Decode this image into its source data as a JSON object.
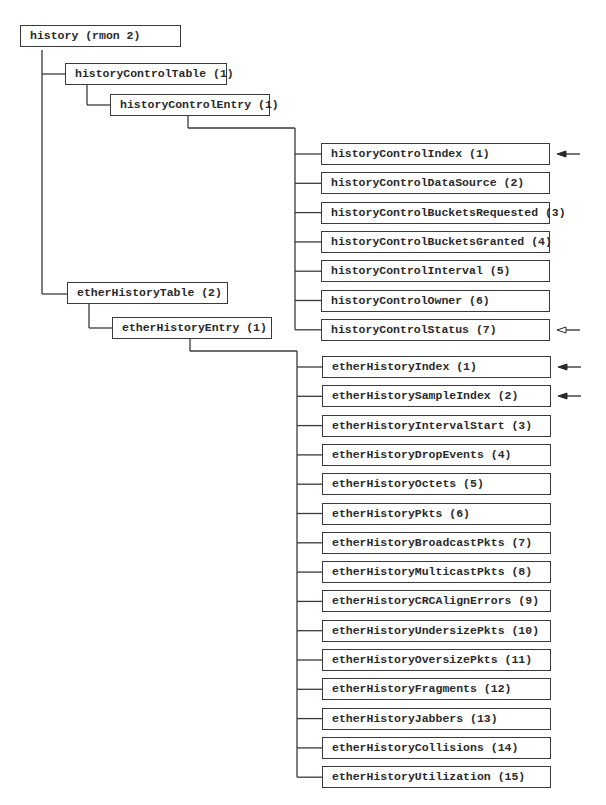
{
  "root": {
    "label": "history (rmon 2)"
  },
  "history_control_table": {
    "label": "historyControlTable (1)"
  },
  "history_control_entry": {
    "label": "historyControlEntry (1)"
  },
  "history_control_columns": [
    {
      "label": "historyControlIndex (1)",
      "arrow": "filled"
    },
    {
      "label": "historyControlDataSource (2)",
      "arrow": "none"
    },
    {
      "label": "historyControlBucketsRequested (3)",
      "arrow": "none"
    },
    {
      "label": "historyControlBucketsGranted (4)",
      "arrow": "none"
    },
    {
      "label": "historyControlInterval (5)",
      "arrow": "none"
    },
    {
      "label": "historyControlOwner (6)",
      "arrow": "none"
    },
    {
      "label": "historyControlStatus (7)",
      "arrow": "hollow"
    }
  ],
  "ether_history_table": {
    "label": "etherHistoryTable (2)"
  },
  "ether_history_entry": {
    "label": "etherHistoryEntry (1)"
  },
  "ether_history_columns": [
    {
      "label": "etherHistoryIndex (1)",
      "arrow": "filled"
    },
    {
      "label": "etherHistorySampleIndex (2)",
      "arrow": "filled"
    },
    {
      "label": "etherHistoryIntervalStart (3)",
      "arrow": "none"
    },
    {
      "label": "etherHistoryDropEvents (4)",
      "arrow": "none"
    },
    {
      "label": "etherHistoryOctets (5)",
      "arrow": "none"
    },
    {
      "label": "etherHistoryPkts (6)",
      "arrow": "none"
    },
    {
      "label": "etherHistoryBroadcastPkts (7)",
      "arrow": "none"
    },
    {
      "label": "etherHistoryMulticastPkts (8)",
      "arrow": "none"
    },
    {
      "label": "etherHistoryCRCAlignErrors (9)",
      "arrow": "none"
    },
    {
      "label": "etherHistoryUndersizePkts (10)",
      "arrow": "none"
    },
    {
      "label": "etherHistoryOversizePkts (11)",
      "arrow": "none"
    },
    {
      "label": "etherHistoryFragments (12)",
      "arrow": "none"
    },
    {
      "label": "etherHistoryJabbers (13)",
      "arrow": "none"
    },
    {
      "label": "etherHistoryCollisions (14)",
      "arrow": "none"
    },
    {
      "label": "etherHistoryUtilization (15)",
      "arrow": "none"
    }
  ],
  "legend": {
    "filled_arrow": "index",
    "hollow_arrow": "status"
  }
}
